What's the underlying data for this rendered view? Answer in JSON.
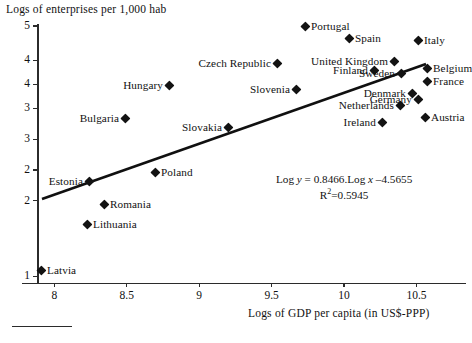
{
  "chart_data": {
    "type": "scatter",
    "title": "",
    "ylabel": "Logs of enterprises per 1,000 hab",
    "xlabel": "Logs of GDP per capita (in US$-PPP)",
    "xlim": [
      7.88,
      10.75
    ],
    "ylim": [
      1.0,
      4.75
    ],
    "grid": false,
    "legend": null,
    "x_ticks": [
      "8",
      "8.5",
      "9",
      "9.5",
      "10",
      "10.5"
    ],
    "x_tick_values": [
      8,
      8.5,
      9,
      9.5,
      10,
      10.5
    ],
    "y_ticks": [
      "5",
      "4",
      "4",
      "3",
      "3",
      "2",
      "2",
      "1"
    ],
    "y_tick_values": [
      4.75,
      4.25,
      3.9,
      3.55,
      3.1,
      2.65,
      2.2,
      1.1
    ],
    "points": [
      {
        "name": "Portugal",
        "x": 9.72,
        "y": 4.62,
        "label_side": "right",
        "px": 305,
        "py": 26
      },
      {
        "name": "Spain",
        "x": 9.94,
        "y": 4.47,
        "label_side": "right",
        "px": 349,
        "py": 38
      },
      {
        "name": "Italy",
        "x": 10.29,
        "y": 4.44,
        "label_side": "right",
        "px": 418,
        "py": 40
      },
      {
        "name": "Czech Republic",
        "x": 9.58,
        "y": 4.14,
        "label_side": "left",
        "px": 277,
        "py": 63
      },
      {
        "name": "United Kingdom",
        "x": 10.13,
        "y": 4.17,
        "label_side": "left",
        "px": 394,
        "py": 61
      },
      {
        "name": "Belgium",
        "x": 10.29,
        "y": 4.07,
        "label_side": "right",
        "px": 427,
        "py": 68
      },
      {
        "name": "Finland",
        "x": 10.03,
        "y": 4.05,
        "label_side": "left",
        "px": 374,
        "py": 70
      },
      {
        "name": "Sweden",
        "x": 10.17,
        "y": 4.01,
        "label_side": "left",
        "px": 401,
        "py": 73
      },
      {
        "name": "France",
        "x": 10.29,
        "y": 3.96,
        "label_side": "right",
        "px": 427,
        "py": 81
      },
      {
        "name": "Hungary",
        "x": 9.06,
        "y": 3.95,
        "label_side": "left",
        "px": 169,
        "py": 85
      },
      {
        "name": "Slovenia",
        "x": 9.68,
        "y": 3.92,
        "label_side": "left",
        "px": 296,
        "py": 89
      },
      {
        "name": "Denmark",
        "x": 10.23,
        "y": 3.88,
        "label_side": "left",
        "px": 412,
        "py": 93
      },
      {
        "name": "Germany",
        "x": 10.26,
        "y": 3.84,
        "label_side": "left",
        "px": 418,
        "py": 99
      },
      {
        "name": "Netherlands",
        "x": 10.17,
        "y": 3.78,
        "label_side": "left",
        "px": 400,
        "py": 105
      },
      {
        "name": "Bulgaria",
        "x": 8.66,
        "y": 3.56,
        "label_side": "left",
        "px": 125,
        "py": 118
      },
      {
        "name": "Austria",
        "x": 10.27,
        "y": 3.71,
        "label_side": "right",
        "px": 425,
        "py": 117
      },
      {
        "name": "Ireland",
        "x": 10.08,
        "y": 3.66,
        "label_side": "left",
        "px": 382,
        "py": 122
      },
      {
        "name": "Slovakia",
        "x": 9.33,
        "y": 3.49,
        "label_side": "left",
        "px": 228,
        "py": 127
      },
      {
        "name": "Estonia",
        "x": 8.79,
        "y": 2.99,
        "label_side": "left",
        "px": 89,
        "py": 181
      },
      {
        "name": "Poland",
        "x": 9.07,
        "y": 2.95,
        "label_side": "right",
        "px": 155,
        "py": 172
      },
      {
        "name": "Romania",
        "x": 8.79,
        "y": 2.47,
        "label_side": "right",
        "px": 104,
        "py": 204
      },
      {
        "name": "Lithuania",
        "x": 8.62,
        "y": 2.13,
        "label_side": "right",
        "px": 87,
        "py": 224
      },
      {
        "name": "Latvia",
        "x": 8.05,
        "y": 1.28,
        "label_side": "right",
        "px": 41,
        "py": 270
      }
    ],
    "regression": {
      "equation_prefix": "Log ",
      "equation_y": "y",
      "equation_mid": " = 0.8466.Log ",
      "equation_x": "x",
      "equation_suffix": " –4.5655",
      "r_squared_prefix": "R",
      "r_squared_sup": "2",
      "r_squared_value": "=0.5945",
      "slope": 0.8466,
      "intercept": -4.5655,
      "r_squared": 0.5945,
      "line_px": {
        "x1": 42,
        "y1": 199,
        "x2": 426,
        "y2": 64
      }
    }
  }
}
